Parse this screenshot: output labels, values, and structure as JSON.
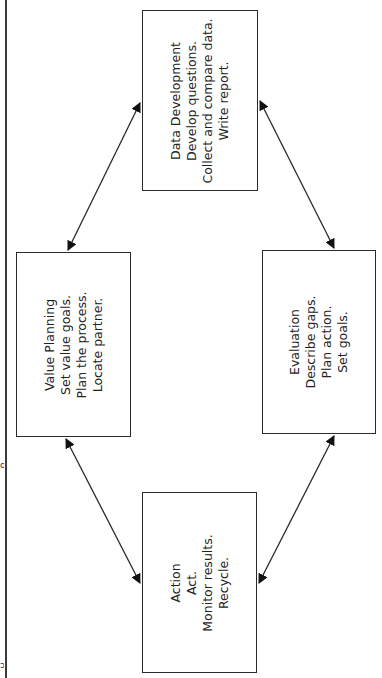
{
  "diagram": {
    "orientation": "rotated -90deg (page shown sideways)",
    "margin_fragments": [
      "o",
      "ɔ"
    ],
    "nodes": [
      {
        "id": "data-development",
        "title": "Data Development",
        "lines": [
          "Develop questions.",
          "Collect and compare data.",
          "Write report."
        ]
      },
      {
        "id": "value-planning",
        "title": "Value Planning",
        "lines": [
          "Set value goals.",
          "Plan the process.",
          "Locate partner."
        ]
      },
      {
        "id": "evaluation",
        "title": "Evaluation",
        "lines": [
          "Describe gaps.",
          "Plan action.",
          "Set goals."
        ]
      },
      {
        "id": "action",
        "title": "Action",
        "lines": [
          "Act.",
          "Monitor results.",
          "Recycle."
        ]
      }
    ],
    "edges": [
      {
        "from": "value-planning",
        "to": "data-development",
        "bidirectional": true
      },
      {
        "from": "data-development",
        "to": "evaluation",
        "bidirectional": true
      },
      {
        "from": "evaluation",
        "to": "action",
        "bidirectional": true
      },
      {
        "from": "action",
        "to": "value-planning",
        "bidirectional": true
      }
    ],
    "colors": {
      "line": "#2a2a2a",
      "text": "#222222",
      "background": "#ffffff"
    }
  }
}
